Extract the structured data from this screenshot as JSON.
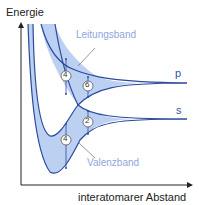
{
  "diagram": {
    "y_axis_label": "Energie",
    "x_axis_label": "interatomarer Abstand",
    "conduction_band_label": "Leitungsband",
    "valence_band_label": "Valenzband",
    "levels": [
      {
        "name": "p",
        "label": "p"
      },
      {
        "name": "s",
        "label": "s"
      }
    ],
    "state_counts": {
      "conduction_left": "4",
      "conduction_right": "6",
      "valence_right": "2",
      "valence_left": "4"
    },
    "colors": {
      "band_fill": "#bcd0f2",
      "band_stroke": "#2d4a9c",
      "axis": "#222222",
      "label": "#8fa6dc"
    }
  }
}
